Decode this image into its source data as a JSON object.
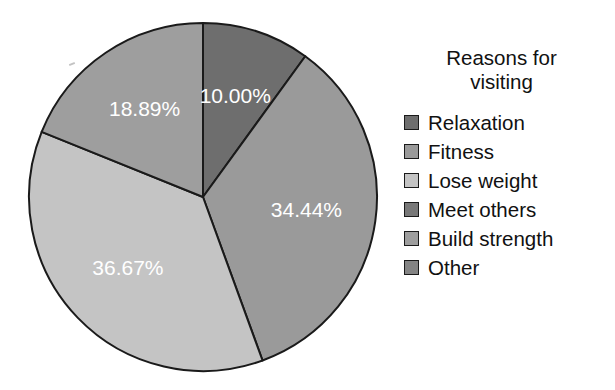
{
  "chart_data": {
    "type": "pie",
    "title": "",
    "legend_title": "Reasons for\nvisiting",
    "legend_position": "right",
    "value_format": "percent",
    "categories": [
      "Relaxation",
      "Fitness",
      "Lose weight",
      "Meet others",
      "Build strength",
      "Other"
    ],
    "values": [
      10.0,
      34.44,
      36.67,
      0,
      18.89,
      0
    ],
    "labels": [
      "10.00%",
      "34.44%",
      "36.67%",
      "",
      "18.89%",
      ""
    ],
    "colors": [
      "#6e6e6e",
      "#9a9a9a",
      "#c4c4c4",
      "#787878",
      "#9e9e9e",
      "#848484"
    ],
    "slices": [
      {
        "name": "Relaxation",
        "value": 10.0,
        "label": "10.00%",
        "color": "#6e6e6e",
        "visible": true
      },
      {
        "name": "Fitness",
        "value": 34.44,
        "label": "34.44%",
        "color": "#9a9a9a",
        "visible": true
      },
      {
        "name": "Lose weight",
        "value": 36.67,
        "label": "36.67%",
        "color": "#c4c4c4",
        "visible": true
      },
      {
        "name": "Meet others",
        "value": 0,
        "label": "",
        "color": "#787878",
        "visible": false
      },
      {
        "name": "Build strength",
        "value": 18.89,
        "label": "18.89%",
        "color": "#9e9e9e",
        "visible": true
      },
      {
        "name": "Other",
        "value": 0,
        "label": "",
        "color": "#848484",
        "visible": false
      }
    ],
    "start_angle_deg": 0,
    "direction": "clockwise",
    "total": 100.0,
    "outline_color": "#1a1a1a",
    "label_color": "#ffffff",
    "background": "#ffffff"
  },
  "legend": {
    "title": "Reasons for\nvisiting",
    "items": [
      {
        "label": "Relaxation",
        "color": "#6e6e6e"
      },
      {
        "label": "Fitness",
        "color": "#9a9a9a"
      },
      {
        "label": "Lose weight",
        "color": "#c4c4c4"
      },
      {
        "label": "Meet others",
        "color": "#787878"
      },
      {
        "label": "Build strength",
        "color": "#9e9e9e"
      },
      {
        "label": "Other",
        "color": "#848484"
      }
    ]
  }
}
